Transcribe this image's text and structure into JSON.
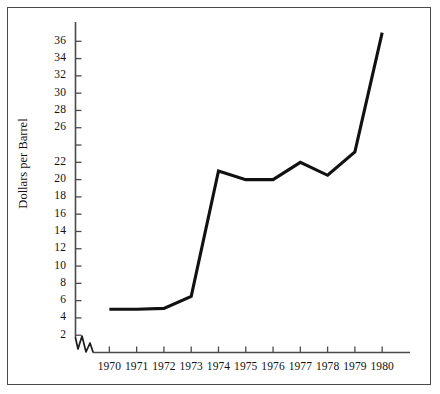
{
  "chart_data": {
    "type": "line",
    "title": "",
    "subtitle": "",
    "xlabel": "",
    "ylabel": "Dollars per Barrel",
    "x": [
      1970,
      1971,
      1972,
      1973,
      1974,
      1975,
      1976,
      1977,
      1978,
      1979,
      1980
    ],
    "categories": [
      "1970",
      "1971",
      "1972",
      "1973",
      "1974",
      "1975",
      "1976",
      "1977",
      "1978",
      "1979",
      "1980"
    ],
    "values": [
      5.0,
      5.0,
      5.1,
      6.5,
      21.0,
      20.0,
      20.0,
      22.0,
      20.5,
      23.2,
      37.0
    ],
    "series": [
      {
        "name": "Dollars per Barrel",
        "values": [
          5.0,
          5.0,
          5.1,
          6.5,
          21.0,
          20.0,
          20.0,
          22.0,
          20.5,
          23.2,
          37.0
        ]
      }
    ],
    "ylim": [
      0,
      38
    ],
    "xlim": [
      1969.4,
      1980.8
    ],
    "ytick_labels": [
      "2",
      "4",
      "6",
      "8",
      "10",
      "12",
      "14",
      "16",
      "18",
      "20",
      "22",
      "",
      "26",
      "28",
      "30",
      "32",
      "34",
      "36"
    ],
    "ytick_values": [
      2,
      4,
      6,
      8,
      10,
      12,
      14,
      16,
      18,
      20,
      22,
      24,
      26,
      28,
      30,
      32,
      34,
      36
    ],
    "xtick_labels": [
      "1970",
      "1971",
      "1972",
      "1973",
      "1974",
      "1975",
      "1976",
      "1977",
      "1978",
      "1979",
      "1980"
    ],
    "grid": false,
    "legend": false,
    "legend_position": "none",
    "axis_break": true,
    "line_color": "#111111",
    "axis_color": "#4a4a4a",
    "frame_color": "#4a4a4a",
    "background_color": "#ffffff"
  }
}
